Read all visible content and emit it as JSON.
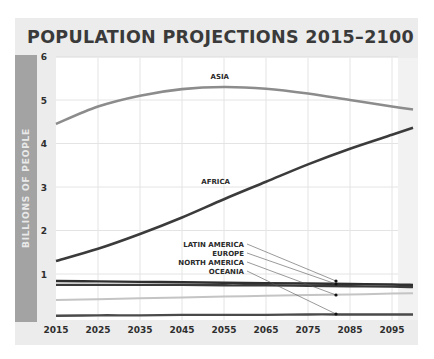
{
  "title": "POPULATION PROJECTIONS 2015–2100",
  "y_axis_label": "BILLIONS OF PEOPLE",
  "colors": {
    "panel": "#ececec",
    "plot": "#ffffff",
    "grid": "#e4e4e4",
    "axis_bar": "#a3a3a3",
    "asia": "#8c8c8c",
    "africa": "#3b3b3b",
    "latin_america": "#2f2f2f",
    "europe": "#3a3a3a",
    "north_america": "#c4c4c4",
    "oceania": "#4a4a4a"
  },
  "chart_data": {
    "type": "line",
    "title": "POPULATION PROJECTIONS 2015–2100",
    "xlabel": "",
    "ylabel": "BILLIONS OF PEOPLE",
    "x_ticks": [
      2015,
      2025,
      2035,
      2045,
      2055,
      2065,
      2075,
      2085,
      2095
    ],
    "y_ticks": [
      1,
      2,
      3,
      4,
      5,
      6
    ],
    "xlim": [
      2015,
      2100
    ],
    "ylim": [
      0,
      6
    ],
    "grid": true,
    "legend": "inline labels with leader lines",
    "x": [
      2015,
      2025,
      2035,
      2045,
      2055,
      2065,
      2075,
      2085,
      2095,
      2100
    ],
    "series": [
      {
        "name": "ASIA",
        "values": [
          4.45,
          4.85,
          5.1,
          5.25,
          5.3,
          5.26,
          5.15,
          5.0,
          4.85,
          4.78
        ]
      },
      {
        "name": "AFRICA",
        "values": [
          1.3,
          1.58,
          1.92,
          2.3,
          2.72,
          3.12,
          3.52,
          3.88,
          4.2,
          4.36
        ]
      },
      {
        "name": "LATIN AMERICA",
        "values": [
          0.84,
          0.83,
          0.82,
          0.81,
          0.8,
          0.79,
          0.78,
          0.77,
          0.76,
          0.75
        ]
      },
      {
        "name": "EUROPE",
        "values": [
          0.75,
          0.75,
          0.75,
          0.75,
          0.74,
          0.74,
          0.73,
          0.72,
          0.71,
          0.7
        ]
      },
      {
        "name": "NORTH AMERICA",
        "values": [
          0.4,
          0.42,
          0.44,
          0.46,
          0.48,
          0.5,
          0.52,
          0.53,
          0.55,
          0.56
        ]
      },
      {
        "name": "OCEANIA",
        "values": [
          0.04,
          0.05,
          0.05,
          0.06,
          0.06,
          0.06,
          0.07,
          0.07,
          0.07,
          0.07
        ]
      }
    ],
    "annotations": [
      {
        "text": "ASIA",
        "x": 2054,
        "y": 5.48
      },
      {
        "text": "AFRICA",
        "x": 2053,
        "y": 3.07
      },
      {
        "text": "LATIN AMERICA",
        "anchor_year": 2081,
        "points_to": 0.84
      },
      {
        "text": "EUROPE",
        "anchor_year": 2081,
        "points_to": 0.77
      },
      {
        "text": "NORTH AMERICA",
        "anchor_year": 2081,
        "points_to": 0.52
      },
      {
        "text": "OCEANIA",
        "anchor_year": 2081,
        "points_to": 0.07
      }
    ]
  },
  "leader_labels": [
    {
      "text": "LATIN AMERICA",
      "label_y": 244,
      "dot_y": 281
    },
    {
      "text": "EUROPE",
      "label_y": 253,
      "dot_y": 284
    },
    {
      "text": "NORTH AMERICA",
      "label_y": 262,
      "dot_y": 295
    },
    {
      "text": "OCEANIA",
      "label_y": 271,
      "dot_y": 314
    }
  ]
}
